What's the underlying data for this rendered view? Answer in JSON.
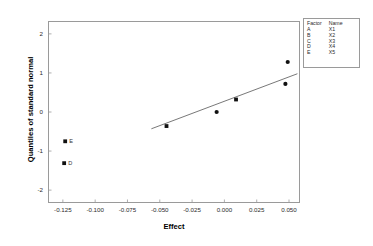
{
  "chart_data": {
    "type": "scatter",
    "title": "",
    "xlabel": "Effect",
    "ylabel": "Quantiles of standard normal",
    "xlim": [
      -0.1365,
      0.0585
    ],
    "ylim": [
      -2.33,
      2.33
    ],
    "xticks": [
      -0.125,
      -0.1,
      -0.075,
      -0.05,
      -0.025,
      0.0,
      0.025,
      0.05
    ],
    "xticklabels": [
      "-0.125",
      "-0.100",
      "-0.075",
      "-0.050",
      "-0.025",
      "0.000",
      "0.025",
      "0.050"
    ],
    "yticks": [
      2,
      1,
      0,
      -1,
      -2
    ],
    "yticklabels": [
      "2",
      "1",
      "0",
      "-1",
      "-2"
    ],
    "grid": false,
    "legend_position": "outside-top-right",
    "points": [
      {
        "x": -0.124,
        "y": -1.31,
        "label": "D",
        "marker": "square",
        "labeled": true
      },
      {
        "x": -0.1232,
        "y": -0.75,
        "label": "E",
        "marker": "square",
        "labeled": true
      },
      {
        "x": -0.0448,
        "y": -0.36,
        "label": "",
        "marker": "square",
        "labeled": false
      },
      {
        "x": -0.006,
        "y": 0.0,
        "label": "",
        "marker": "circle",
        "labeled": false
      },
      {
        "x": 0.009,
        "y": 0.32,
        "label": "",
        "marker": "square",
        "labeled": false
      },
      {
        "x": 0.0472,
        "y": 0.72,
        "label": "",
        "marker": "circle",
        "labeled": false
      },
      {
        "x": 0.049,
        "y": 1.28,
        "label": "",
        "marker": "circle",
        "labeled": false
      }
    ],
    "reference_line": {
      "x0": -0.0565,
      "y0": -0.43,
      "x1": 0.0565,
      "y1": 0.98
    },
    "colors": {
      "marker": "#111111",
      "line": "#555555",
      "frame": "#9a9a9a",
      "text": "#2b2b2b"
    }
  },
  "legend": {
    "headers": [
      "Factor",
      "Name"
    ],
    "rows": [
      {
        "factor": "A",
        "name": "X1"
      },
      {
        "factor": "B",
        "name": "X2"
      },
      {
        "factor": "C",
        "name": "X3"
      },
      {
        "factor": "D",
        "name": "X4"
      },
      {
        "factor": "E",
        "name": "X5"
      }
    ]
  }
}
